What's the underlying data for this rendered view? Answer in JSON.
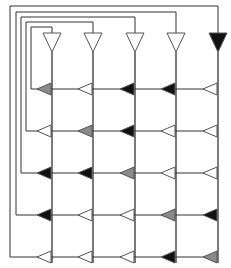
{
  "diagram": {
    "title": "",
    "width": 231,
    "height": 268,
    "colors": {
      "line": "#333333",
      "white": "#ffffff",
      "gray": "#8a8a8a",
      "black": "#111111",
      "stroke": "#555555"
    },
    "columns_x": [
      52,
      93,
      135,
      176,
      218
    ],
    "rows_y": [
      89,
      131,
      173,
      215,
      257
    ],
    "feedback_lines_x": [
      31,
      26,
      21,
      16,
      10
    ],
    "feedback_lines_top_y": [
      27,
      22,
      17,
      12,
      6
    ],
    "top_triangles": [
      "white",
      "white",
      "white",
      "white",
      "black"
    ],
    "grid": [
      [
        "gray",
        "white",
        "black",
        "black",
        "white"
      ],
      [
        "white",
        "gray",
        "black",
        "white",
        "white"
      ],
      [
        "black",
        "black",
        "gray",
        "white",
        "white"
      ],
      [
        "black",
        "white",
        "white",
        "gray",
        "black"
      ],
      [
        "white",
        "white",
        "white",
        "black",
        "gray"
      ]
    ]
  }
}
